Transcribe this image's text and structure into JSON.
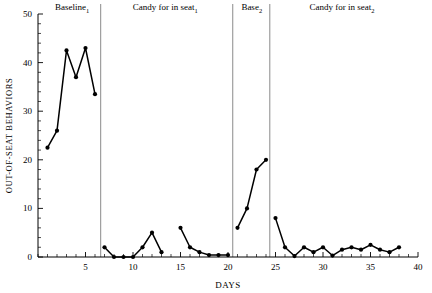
{
  "chart_data": {
    "type": "line",
    "title": "",
    "xlabel": "DAYS",
    "ylabel": "OUT-OF-SEAT BEHAVIORS",
    "xlim": [
      0,
      40
    ],
    "ylim": [
      0,
      50
    ],
    "xticks": [
      5,
      10,
      15,
      20,
      25,
      30,
      35,
      40
    ],
    "xtick_labels": [
      "5",
      "10",
      "15",
      "20",
      "25",
      "30",
      "35",
      "40"
    ],
    "xtick_minor_step": 1,
    "yticks": [
      0,
      10,
      20,
      30,
      40,
      50
    ],
    "ytick_labels": [
      "0",
      "10",
      "20",
      "30",
      "40",
      "50"
    ],
    "ytick_minor_step": 2,
    "grid": false,
    "legend": null,
    "marker": "filled-circle",
    "line_color": "#000000",
    "phases": [
      {
        "name": "baseline-1",
        "label": "Baseline",
        "label_sub": "1",
        "label_x": 3.6,
        "x_start": 0.0,
        "x_end": 6.6,
        "x": [
          1,
          2,
          3,
          4,
          5,
          6
        ],
        "values": [
          22.5,
          26,
          42.5,
          37,
          43,
          33.5
        ]
      },
      {
        "name": "candy-for-in-seat-1",
        "label": "Candy for in seat",
        "label_sub": "1",
        "label_x": 13.4,
        "x_start": 6.6,
        "x_end": 20.5,
        "segments": [
          {
            "x": [
              7,
              8,
              9,
              10,
              11,
              12,
              13
            ],
            "values": [
              2,
              0,
              0,
              0,
              2,
              5,
              1
            ]
          },
          {
            "x": [
              15,
              16,
              17,
              18,
              19,
              20
            ],
            "values": [
              6,
              2,
              1,
              0.4,
              0.4,
              0.4
            ]
          }
        ]
      },
      {
        "name": "base-2",
        "label": "Base",
        "label_sub": "2",
        "label_x": 22.5,
        "x_start": 20.5,
        "x_end": 24.4,
        "x": [
          21,
          22,
          23,
          24
        ],
        "values": [
          6,
          10,
          18,
          20
        ]
      },
      {
        "name": "candy-for-in-seat-2",
        "label": "Candy for in seat",
        "label_sub": "2",
        "label_x": 32.0,
        "x_start": 24.4,
        "x_end": 40.0,
        "x": [
          25,
          26,
          27,
          28,
          29,
          30,
          31,
          32,
          33,
          34,
          35,
          36,
          37,
          38
        ],
        "values": [
          8,
          2,
          0.2,
          2,
          1,
          2,
          0.3,
          1.5,
          2,
          1.5,
          2.5,
          1.5,
          1,
          2
        ]
      }
    ],
    "dividers": [
      6.6,
      20.5,
      24.4
    ]
  }
}
